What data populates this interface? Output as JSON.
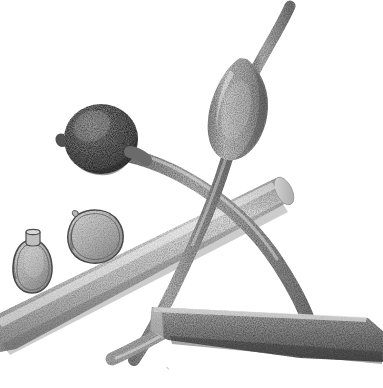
{
  "illustration": {
    "title": "Botanical stipple illustration",
    "medium": "pen-and-ink stipple drawing",
    "background_color": "#ffffff",
    "ink_color": "#555555",
    "canvas": {
      "width": 383,
      "height": 388
    },
    "caption_mark": "⸜",
    "subjects": [
      {
        "name": "round-gall",
        "label": "dark globose gall",
        "tone": "dark",
        "fill_color": "#6e6e6e",
        "center": [
          101,
          139
        ],
        "radius_x": 36,
        "radius_y": 34,
        "has_basal-nub": true
      },
      {
        "name": "spindle-gall",
        "label": "fusiform stem swelling",
        "tone": "medium",
        "fill_color": "#9a9a9a",
        "center": [
          243,
          105
        ],
        "length": 96,
        "width": 42
      },
      {
        "name": "seed-specimen-left",
        "label": "flask-shaped seed with collar",
        "tone": "light",
        "fill_color": "#b5b5b5",
        "outline_color": "#4a4a4a",
        "center": [
          34,
          264
        ],
        "width": 38,
        "height": 56
      },
      {
        "name": "seed-specimen-right",
        "label": "obovate seed, tilted",
        "tone": "light",
        "fill_color": "#b0b0b0",
        "outline_color": "#4a4a4a",
        "center": [
          95,
          235
        ],
        "width": 50,
        "height": 48
      },
      {
        "name": "diagonal-branch",
        "label": "cylindrical stem, upper, cut end",
        "tone": "light-medium",
        "fill_color": "#c0c0c0",
        "from": [
          0,
          332
        ],
        "to": [
          288,
          192
        ],
        "thickness": 34
      },
      {
        "name": "lower-branch",
        "label": "cylindrical stem, lower, shaded",
        "tone": "medium-dark",
        "fill_color": "#8c8c8c",
        "from": [
          150,
          305
        ],
        "to": [
          370,
          330
        ],
        "thickness": 42
      },
      {
        "name": "arching-stem",
        "label": "arching stem bearing round gall",
        "tone": "medium",
        "fill_color": "#969696",
        "thickness": 13
      },
      {
        "name": "vertical-stem",
        "label": "stem bearing spindle gall",
        "tone": "medium",
        "fill_color": "#909090",
        "thickness": 12
      },
      {
        "name": "short-shoot",
        "label": "short shoot with rounded tip",
        "tone": "light",
        "fill_color": "#a8a8a8",
        "tip": [
          106,
          361
        ]
      }
    ]
  }
}
